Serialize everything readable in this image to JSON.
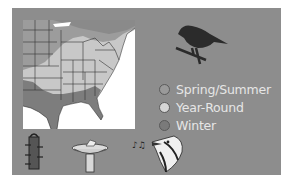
{
  "legend": {
    "items": [
      {
        "label": "Spring/Summer",
        "color": "#9a9a9a"
      },
      {
        "label": "Year-Round",
        "color": "#d6d6d6"
      },
      {
        "label": "Winter",
        "color": "#7a7a7a"
      }
    ]
  },
  "icons": {
    "bird": "perched-bird-silhouette",
    "feeder": "tube-feeder",
    "birdbath": "birdbath",
    "song": "singing-bird-head"
  },
  "colors": {
    "panel": "#8d8d8d",
    "map_background": "#ffffff",
    "year_round": "#c8c8c8",
    "spring_summer": "#9a9a9a",
    "winter": "#7d7d7d",
    "bird": "#2b2b2b"
  }
}
